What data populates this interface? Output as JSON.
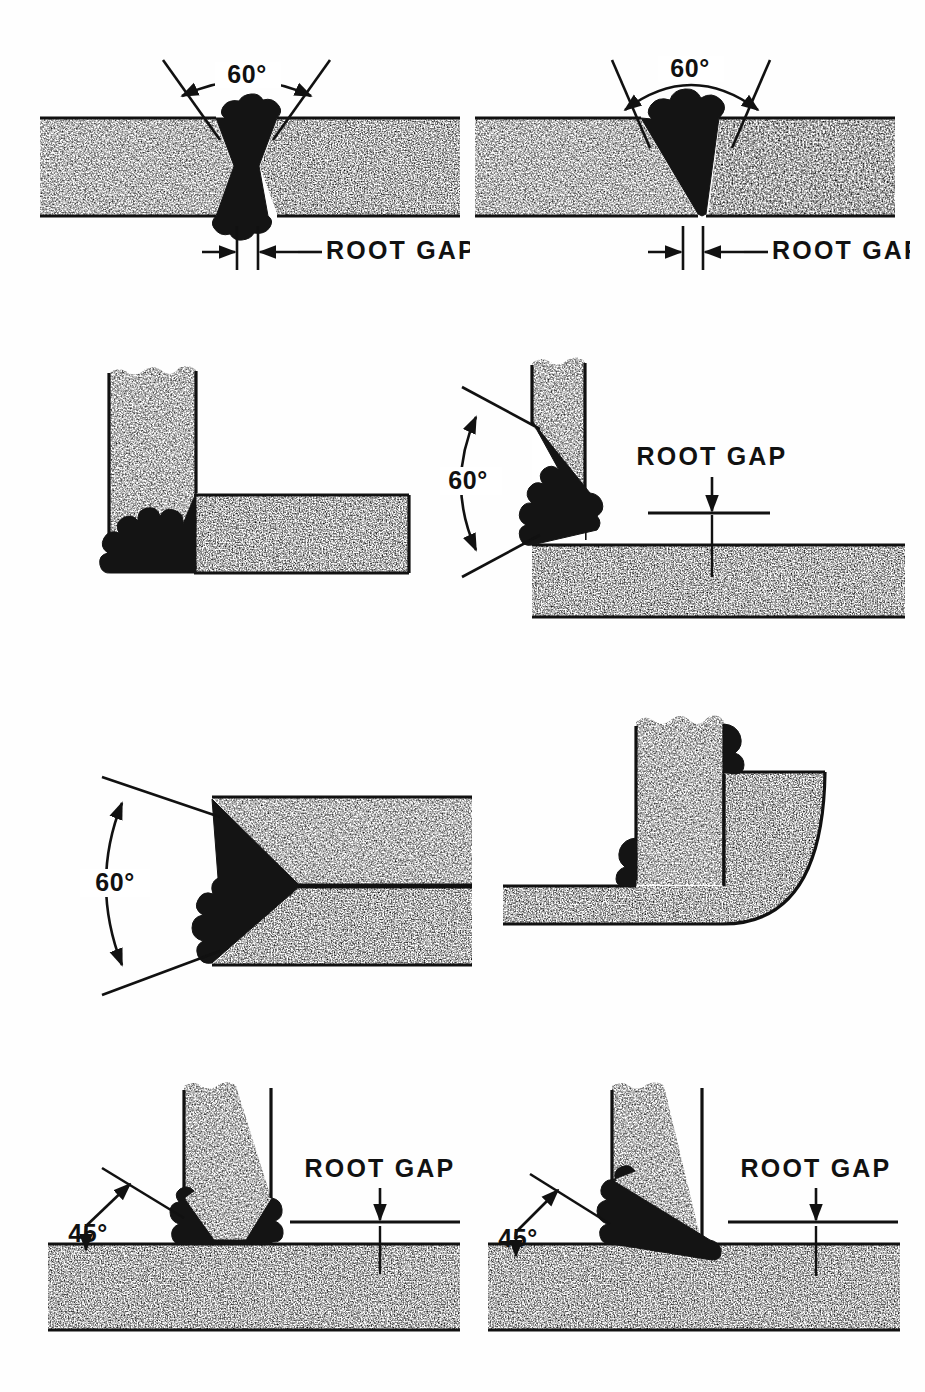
{
  "figure": {
    "kind": "technical-line-drawing",
    "canvas": {
      "width": 925,
      "height": 1392
    },
    "ink_color": "#111111",
    "weld_color": "#141414",
    "background_color": "#ffffff",
    "hatch_style": "random-stipple-speckle"
  },
  "labels": {
    "angle_60": "60°",
    "angle_45": "45°",
    "root_gap": "ROOT GAP"
  },
  "panels": [
    {
      "id": "p1",
      "name": "double-v-butt-joint",
      "row": 1,
      "col": 1,
      "joint_type": "butt",
      "preparation": "double-V (X) groove",
      "included_angle": "60°",
      "angle_label": "60°",
      "gap_label": "ROOT GAP",
      "has_root_gap_dimension": true,
      "weld_sides": 2
    },
    {
      "id": "p2",
      "name": "single-v-butt-joint",
      "row": 1,
      "col": 2,
      "joint_type": "butt",
      "preparation": "single-V groove",
      "included_angle": "60°",
      "angle_label": "60°",
      "gap_label": "ROOT GAP",
      "has_root_gap_dimension": true,
      "weld_sides": 1
    },
    {
      "id": "p3",
      "name": "square-corner-joint",
      "row": 2,
      "col": 1,
      "joint_type": "corner",
      "preparation": "square edge, no bevel",
      "included_angle": null,
      "angle_label": "",
      "gap_label": "",
      "has_root_gap_dimension": false,
      "weld_sides": 1
    },
    {
      "id": "p4",
      "name": "bevelled-corner-joint",
      "row": 2,
      "col": 2,
      "joint_type": "corner",
      "preparation": "single-bevel groove",
      "included_angle": "60°",
      "angle_label": "60°",
      "gap_label": "ROOT GAP",
      "has_root_gap_dimension": true,
      "weld_sides": 1
    },
    {
      "id": "p5",
      "name": "single-v-edge-butt-joint",
      "row": 3,
      "col": 1,
      "joint_type": "butt",
      "preparation": "single-V groove, horizontal plates",
      "included_angle": "60°",
      "angle_label": "60°",
      "gap_label": "",
      "has_root_gap_dimension": false,
      "weld_sides": 1
    },
    {
      "id": "p6",
      "name": "lap-corner-fillet-joint",
      "row": 3,
      "col": 2,
      "joint_type": "corner-lap",
      "preparation": "square edge, fillet welds both sides",
      "included_angle": null,
      "angle_label": "",
      "gap_label": "",
      "has_root_gap_dimension": false,
      "weld_sides": 2
    },
    {
      "id": "p7",
      "name": "double-bevel-tee-joint",
      "row": 4,
      "col": 1,
      "joint_type": "tee",
      "preparation": "double-bevel groove",
      "included_angle": "45°",
      "angle_label": "45°",
      "gap_label": "ROOT GAP",
      "has_root_gap_dimension": true,
      "weld_sides": 2
    },
    {
      "id": "p8",
      "name": "single-bevel-tee-joint",
      "row": 4,
      "col": 2,
      "joint_type": "tee",
      "preparation": "single-bevel groove",
      "included_angle": "45°",
      "angle_label": "45°",
      "gap_label": "ROOT GAP",
      "has_root_gap_dimension": true,
      "weld_sides": 1
    }
  ]
}
